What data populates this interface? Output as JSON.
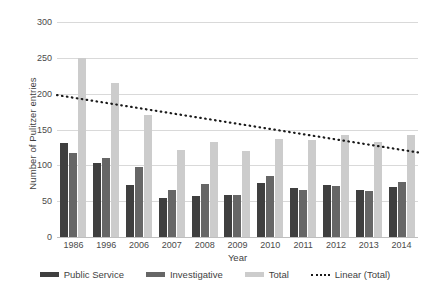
{
  "chart_data": {
    "type": "bar",
    "title": "",
    "xlabel": "Year",
    "ylabel": "Number of Pulitzer entries",
    "categories": [
      "1986",
      "1996",
      "2006",
      "2007",
      "2008",
      "2009",
      "2010",
      "2011",
      "2012",
      "2013",
      "2014"
    ],
    "ylim": [
      0,
      300
    ],
    "yticks": [
      0,
      50,
      100,
      150,
      200,
      250,
      300
    ],
    "ytick_labels": [
      "0",
      "50",
      "100",
      "150",
      "200",
      "250",
      "300"
    ],
    "grid": true,
    "legend_position": "bottom",
    "series": [
      {
        "name": "Public Service",
        "color": "#3f3f3f",
        "values": [
          131,
          103,
          72,
          54,
          57,
          59,
          75,
          68,
          72,
          65,
          70
        ]
      },
      {
        "name": "Investigative",
        "color": "#666666",
        "values": [
          117,
          110,
          98,
          66,
          74,
          59,
          85,
          65,
          71,
          64,
          77
        ]
      },
      {
        "name": "Total",
        "color": "#cccccc",
        "values": [
          250,
          215,
          170,
          121,
          132,
          120,
          137,
          135,
          142,
          133,
          143
        ]
      }
    ],
    "trendline": {
      "name": "Linear (Total)",
      "color": "#1a1a1a",
      "style": "dotted",
      "start_value": 198,
      "end_value": 118
    }
  },
  "legend": {
    "items": [
      {
        "label": "Public Service",
        "swatch": "public-service"
      },
      {
        "label": "Investigative",
        "swatch": "investigative"
      },
      {
        "label": "Total",
        "swatch": "total"
      },
      {
        "label": "Linear (Total)",
        "swatch": "trend"
      }
    ]
  }
}
